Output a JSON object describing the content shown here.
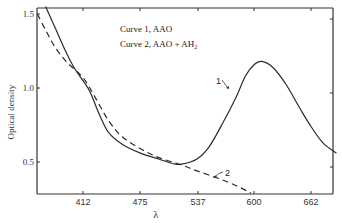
{
  "chart_data": {
    "type": "line",
    "title": "",
    "xlabel": "λ",
    "ylabel": "Optical density",
    "xlim": [
      360,
      700
    ],
    "ylim": [
      0.28,
      1.55
    ],
    "x_ticks": [
      412,
      475,
      537,
      600,
      662
    ],
    "y_ticks": [
      0.5,
      1.0,
      1.5
    ],
    "grid": false,
    "legend": {
      "position": "upper-left-inside",
      "entries": [
        "Curve 1, AAO",
        "Curve 2, AAO + AH₂"
      ]
    },
    "series": [
      {
        "name": "Curve 1, AAO",
        "style": "solid",
        "label": "1",
        "points": [
          [
            371,
            1.55
          ],
          [
            382,
            1.4
          ],
          [
            392,
            1.26
          ],
          [
            402,
            1.14
          ],
          [
            412,
            1.05
          ],
          [
            420,
            0.97
          ],
          [
            430,
            0.82
          ],
          [
            440,
            0.7
          ],
          [
            455,
            0.62
          ],
          [
            475,
            0.56
          ],
          [
            495,
            0.52
          ],
          [
            510,
            0.49
          ],
          [
            520,
            0.485
          ],
          [
            537,
            0.52
          ],
          [
            550,
            0.6
          ],
          [
            565,
            0.76
          ],
          [
            580,
            0.94
          ],
          [
            590,
            1.08
          ],
          [
            600,
            1.16
          ],
          [
            608,
            1.18
          ],
          [
            620,
            1.14
          ],
          [
            635,
            1.02
          ],
          [
            650,
            0.86
          ],
          [
            662,
            0.74
          ],
          [
            675,
            0.63
          ],
          [
            690,
            0.56
          ]
        ]
      },
      {
        "name": "Curve 2, AAO + AH₂",
        "style": "dashed",
        "label": "2",
        "points": [
          [
            362,
            1.5
          ],
          [
            372,
            1.38
          ],
          [
            382,
            1.27
          ],
          [
            395,
            1.17
          ],
          [
            412,
            1.07
          ],
          [
            425,
            0.94
          ],
          [
            440,
            0.78
          ],
          [
            455,
            0.67
          ],
          [
            475,
            0.59
          ],
          [
            495,
            0.53
          ],
          [
            520,
            0.48
          ],
          [
            537,
            0.44
          ],
          [
            560,
            0.39
          ],
          [
            580,
            0.34
          ],
          [
            596,
            0.29
          ]
        ]
      }
    ]
  },
  "legend": {
    "line1": "Curve 1, AAO",
    "line2_prefix": "Curve 2, AAO + AH",
    "line2_sub": "2"
  },
  "labels": {
    "curve1": "1",
    "curve2": "2",
    "ylabel": "Optical density",
    "xlabel": "λ"
  },
  "ticks": {
    "x": [
      "412",
      "475",
      "537",
      "600",
      "662"
    ],
    "y": [
      "1.5",
      "1.0",
      "0.5"
    ]
  }
}
